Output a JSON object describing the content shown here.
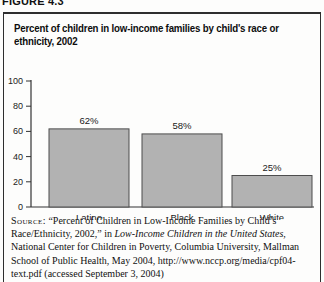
{
  "figure": {
    "label": "FIGURE 4.3"
  },
  "title_lines": {
    "0": "Percent of children in low-income families by child's race or",
    "1": "ethnicity, 2002"
  },
  "chart_data": {
    "type": "bar",
    "title": "Percent of children in low-income families by child's race or ethnicity, 2002",
    "categories": [
      "Latino",
      "Black",
      "White"
    ],
    "values": [
      62,
      58,
      25
    ],
    "value_labels": [
      "62%",
      "58%",
      "25%"
    ],
    "xlabel": "",
    "ylabel": "",
    "ylim": [
      0,
      100
    ],
    "yticks": [
      0,
      20,
      40,
      60,
      80,
      100
    ],
    "grid": false,
    "legend": "none",
    "bar_color": "#b2b2b2",
    "bar_border_color": "#4d4d4d",
    "axis_color": "#333333"
  },
  "source": {
    "label": "Source:",
    "text_before_italic": "“Percent of Children in Low-Income Families by Child’s Race/Ethnicity, 2002,” in ",
    "italic_title": "Low-Income Children in the United States,",
    "text_after_italic": " National Center for Children in Poverty, Columbia University, Mallman School of Public Health, May 2004, http://www.nccp.org/media/cpf04-text.pdf (accessed September 3, 2004)"
  }
}
